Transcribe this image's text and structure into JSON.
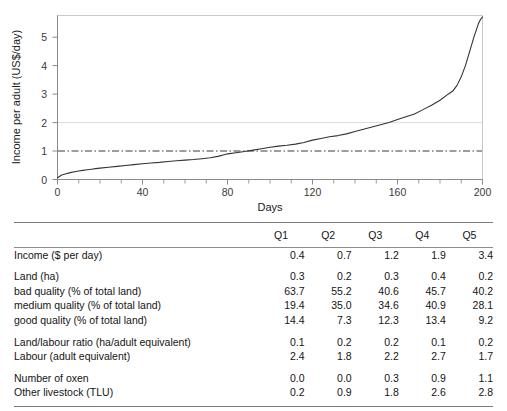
{
  "chart_data": {
    "type": "line",
    "title": "",
    "xlabel": "Days",
    "ylabel": "Income per adult (US$/day)",
    "xlim": [
      0,
      200
    ],
    "ylim": [
      0,
      5.75
    ],
    "xticks": [
      "0",
      "40",
      "80",
      "120",
      "160",
      "200"
    ],
    "xtick_values": [
      0,
      40,
      80,
      120,
      160,
      200
    ],
    "yticks": [
      "0",
      "1",
      "2",
      "3",
      "4",
      "5"
    ],
    "ytick_values": [
      0,
      1,
      2,
      3,
      4,
      5
    ],
    "grid": "horizontal gridline at y = 2 only",
    "legend": "none",
    "reference_lines": [
      {
        "name": "one-dollar-per-day-line",
        "y": 1.0,
        "style": "dash-dot",
        "color": "#333333"
      }
    ],
    "series": [
      {
        "name": "Income per adult (sorted ascending)",
        "color": "#333333",
        "x": [
          0,
          2,
          4,
          6,
          8,
          10,
          12,
          14,
          16,
          18,
          20,
          24,
          28,
          32,
          36,
          40,
          44,
          48,
          52,
          56,
          60,
          64,
          68,
          72,
          76,
          78,
          80,
          84,
          88,
          92,
          96,
          100,
          104,
          108,
          112,
          116,
          120,
          124,
          128,
          132,
          136,
          140,
          144,
          148,
          152,
          156,
          160,
          164,
          168,
          172,
          176,
          180,
          184,
          186,
          188,
          190,
          192,
          194,
          196,
          198,
          199,
          200
        ],
        "y": [
          0.06,
          0.16,
          0.2,
          0.24,
          0.27,
          0.3,
          0.32,
          0.34,
          0.36,
          0.38,
          0.4,
          0.43,
          0.46,
          0.49,
          0.52,
          0.55,
          0.58,
          0.6,
          0.63,
          0.66,
          0.68,
          0.7,
          0.73,
          0.76,
          0.82,
          0.86,
          0.9,
          0.94,
          0.98,
          1.03,
          1.08,
          1.13,
          1.17,
          1.2,
          1.24,
          1.3,
          1.38,
          1.44,
          1.5,
          1.54,
          1.6,
          1.68,
          1.76,
          1.84,
          1.92,
          2.0,
          2.1,
          2.2,
          2.3,
          2.45,
          2.6,
          2.78,
          3.0,
          3.1,
          3.3,
          3.6,
          4.0,
          4.5,
          5.0,
          5.45,
          5.6,
          5.7
        ]
      }
    ]
  },
  "table": {
    "columns": [
      "",
      "Q1",
      "Q2",
      "Q3",
      "Q4",
      "Q5"
    ],
    "rows": [
      {
        "label": "Income ($ per day)",
        "indent": false,
        "gap_before": false,
        "values": [
          "0.4",
          "0.7",
          "1.2",
          "1.9",
          "3.4"
        ]
      },
      {
        "label": "Land  (ha)",
        "indent": false,
        "gap_before": true,
        "values": [
          "0.3",
          "0.2",
          "0.3",
          "0.4",
          "0.2"
        ]
      },
      {
        "label": "bad quality (% of total land)",
        "indent": true,
        "gap_before": false,
        "values": [
          "63.7",
          "55.2",
          "40.6",
          "45.7",
          "40.2"
        ]
      },
      {
        "label": "medium quality (% of total land)",
        "indent": true,
        "gap_before": false,
        "values": [
          "19.4",
          "35.0",
          "34.6",
          "40.9",
          "28.1"
        ]
      },
      {
        "label": "good quality (% of total land)",
        "indent": true,
        "gap_before": false,
        "values": [
          "14.4",
          "7.3",
          "12.3",
          "13.4",
          "9.2"
        ]
      },
      {
        "label": "Land/labour ratio (ha/adult equivalent)",
        "indent": false,
        "gap_before": true,
        "values": [
          "0.1",
          "0.2",
          "0.2",
          "0.1",
          "0.2"
        ]
      },
      {
        "label": "Labour (adult equivalent)",
        "indent": false,
        "gap_before": false,
        "values": [
          "2.4",
          "1.8",
          "2.2",
          "2.7",
          "1.7"
        ]
      },
      {
        "label": "Number of oxen",
        "indent": false,
        "gap_before": true,
        "values": [
          "0.0",
          "0.0",
          "0.3",
          "0.9",
          "1.1"
        ]
      },
      {
        "label": "Other livestock (TLU)",
        "indent": false,
        "gap_before": false,
        "values": [
          "0.2",
          "0.9",
          "1.8",
          "2.6",
          "2.8"
        ]
      }
    ]
  },
  "footnote": {
    "text": ""
  }
}
